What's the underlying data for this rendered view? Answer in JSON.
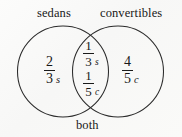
{
  "figure": {
    "type": "venn-diagram",
    "title": "",
    "stroke_color": "#2b2b2b",
    "text_color": "#181818",
    "background_color": "#fbfbfa"
  },
  "labels": {
    "left_circle": "sedans",
    "right_circle": "convertibles",
    "intersection": "both"
  },
  "regions": {
    "left_only": {
      "numerator": "2",
      "denominator": "3",
      "variable": "s"
    },
    "intersection_top": {
      "numerator": "1",
      "denominator": "3",
      "variable": "s"
    },
    "intersection_bottom": {
      "numerator": "1",
      "denominator": "5",
      "variable": "c"
    },
    "right_only": {
      "numerator": "4",
      "denominator": "5",
      "variable": "c"
    }
  }
}
